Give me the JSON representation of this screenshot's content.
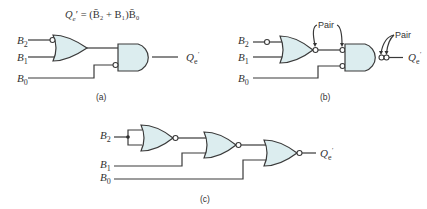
{
  "equation": {
    "lhs": "Q",
    "lhs_sub": "e",
    "rhs_text": " = (B̄₂ + B₁)B̄₀"
  },
  "inputs": {
    "b2": {
      "base": "B",
      "sub": "2"
    },
    "b1": {
      "base": "B",
      "sub": "1"
    },
    "b0": {
      "base": "B",
      "sub": "0"
    }
  },
  "output": {
    "base": "Q",
    "sub": "e",
    "prime": "′"
  },
  "annotations": {
    "pair": "Pair"
  },
  "captions": {
    "a": "(a)",
    "b": "(b)",
    "c": "(c)"
  },
  "colors": {
    "gate_fill": "#dcedef",
    "wire": "#3a3a3a"
  },
  "diagrams": [
    {
      "id": "a",
      "gates": [
        "OR (B2 inverted input)",
        "AND (B0 inverted input)"
      ]
    },
    {
      "id": "b",
      "gates": [
        "OR with inverted output",
        "AND with inverted inputs, double-inverted output"
      ]
    },
    {
      "id": "c",
      "gates": [
        "NOR (B2 tied inputs)",
        "NOR",
        "NOR"
      ]
    }
  ]
}
